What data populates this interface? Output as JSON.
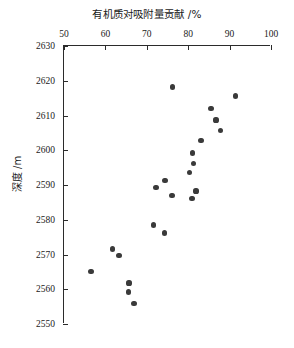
{
  "chart_data": {
    "type": "scatter",
    "title": "有机质对吸附量贡献 /%",
    "xlabel": "有机质对吸附量贡献 /%",
    "ylabel": "深度 /m",
    "xlim": [
      50,
      100
    ],
    "ylim": [
      2550,
      2630
    ],
    "y_inverted": true,
    "grid": false,
    "legend": null,
    "xticks": [
      50,
      60,
      70,
      80,
      90,
      100
    ],
    "xtick_labels": [
      "50",
      "60",
      "70",
      "80",
      "90",
      "100"
    ],
    "yticks": [
      2630,
      2620,
      2610,
      2600,
      2590,
      2580,
      2570,
      2560,
      2550
    ],
    "ytick_labels": [
      "2630",
      "2620",
      "2610",
      "2600",
      "2590",
      "2580",
      "2570",
      "2560",
      "2550"
    ],
    "marker": "filled-circle",
    "marker_color": "#3a3a3a",
    "points": [
      {
        "x": 76.3,
        "y": 2618.2
      },
      {
        "x": 91.5,
        "y": 2615.6
      },
      {
        "x": 85.5,
        "y": 2611.9
      },
      {
        "x": 86.7,
        "y": 2608.7
      },
      {
        "x": 87.9,
        "y": 2605.8
      },
      {
        "x": 83.1,
        "y": 2602.9
      },
      {
        "x": 81.1,
        "y": 2599.2
      },
      {
        "x": 81.3,
        "y": 2596.3
      },
      {
        "x": 80.4,
        "y": 2593.7
      },
      {
        "x": 74.4,
        "y": 2591.2
      },
      {
        "x": 72.2,
        "y": 2589.2
      },
      {
        "x": 76.1,
        "y": 2587.0
      },
      {
        "x": 81.9,
        "y": 2588.3
      },
      {
        "x": 80.9,
        "y": 2586.2
      },
      {
        "x": 71.7,
        "y": 2578.5
      },
      {
        "x": 74.2,
        "y": 2576.2
      },
      {
        "x": 61.8,
        "y": 2571.6
      },
      {
        "x": 63.3,
        "y": 2569.6
      },
      {
        "x": 56.5,
        "y": 2565.2
      },
      {
        "x": 65.7,
        "y": 2561.8
      },
      {
        "x": 65.5,
        "y": 2559.2
      },
      {
        "x": 66.9,
        "y": 2555.8
      }
    ]
  }
}
